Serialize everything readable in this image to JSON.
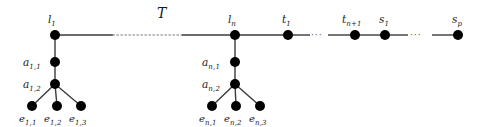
{
  "figure": {
    "tree_name": "T",
    "width": 482,
    "height": 127,
    "background_color": "#ffffff",
    "node_color": "#000000",
    "edge_color": "#3a3a3a",
    "dotted_edge_color": "#9a9a9a"
  },
  "spine": {
    "nodes": [
      {
        "id": "l1",
        "base": "l",
        "sub": "1",
        "x": 55,
        "y": 35,
        "r": 5
      },
      {
        "id": "ln",
        "base": "l",
        "sub": "n",
        "x": 235,
        "y": 35,
        "r": 5
      },
      {
        "id": "t1",
        "base": "t",
        "sub": "1",
        "x": 288,
        "y": 35,
        "r": 5
      },
      {
        "id": "tn1",
        "base": "t",
        "sub": "n+1",
        "x": 355,
        "y": 35,
        "r": 5
      },
      {
        "id": "s1",
        "base": "s",
        "sub": "1",
        "x": 385,
        "y": 35,
        "r": 5
      },
      {
        "id": "sp",
        "base": "s",
        "sub": "p",
        "x": 458,
        "y": 35,
        "r": 5
      }
    ],
    "ellipses": [
      {
        "id": "ell-t",
        "x": 318,
        "y": 32,
        "text": "···"
      },
      {
        "id": "ell-s",
        "x": 415,
        "y": 32,
        "text": "···"
      }
    ]
  },
  "subtrees": [
    {
      "id": "subtree-1",
      "root": "l1",
      "chain": [
        {
          "id": "a11",
          "base": "a",
          "sub": "1,1",
          "x": 55,
          "y": 62,
          "r": 5
        },
        {
          "id": "a12",
          "base": "a",
          "sub": "1,2",
          "x": 55,
          "y": 84,
          "r": 5
        }
      ],
      "leaves": [
        {
          "id": "e11",
          "base": "e",
          "sub": "1,1",
          "x": 32,
          "y": 106,
          "r": 5
        },
        {
          "id": "e12",
          "base": "e",
          "sub": "1,2",
          "x": 57,
          "y": 106,
          "r": 5
        },
        {
          "id": "e13",
          "base": "e",
          "sub": "1,3",
          "x": 81,
          "y": 106,
          "r": 5
        }
      ]
    },
    {
      "id": "subtree-n",
      "root": "ln",
      "chain": [
        {
          "id": "an1",
          "base": "a",
          "sub": "n,1",
          "x": 235,
          "y": 62,
          "r": 5
        },
        {
          "id": "an2",
          "base": "a",
          "sub": "n,2",
          "x": 235,
          "y": 84,
          "r": 5
        }
      ],
      "leaves": [
        {
          "id": "en1",
          "base": "e",
          "sub": "n,1",
          "x": 212,
          "y": 106,
          "r": 5
        },
        {
          "id": "en2",
          "base": "e",
          "sub": "n,2",
          "x": 236,
          "y": 106,
          "r": 5
        },
        {
          "id": "en3",
          "base": "e",
          "sub": "n,3",
          "x": 260,
          "y": 106,
          "r": 5
        }
      ]
    }
  ]
}
